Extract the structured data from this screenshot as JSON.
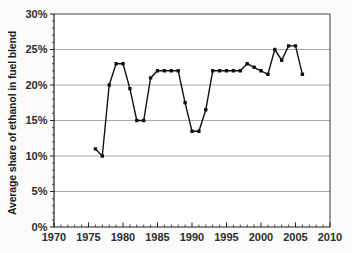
{
  "chart_data": {
    "type": "line",
    "title": "",
    "xlabel": "",
    "ylabel": "Average share of ethanol in fuel blend",
    "x": [
      1976,
      1977,
      1978,
      1979,
      1980,
      1981,
      1982,
      1983,
      1984,
      1985,
      1986,
      1987,
      1988,
      1989,
      1990,
      1991,
      1992,
      1993,
      1994,
      1995,
      1996,
      1997,
      1998,
      1999,
      2000,
      2001,
      2002,
      2003,
      2004,
      2005,
      2006
    ],
    "values": [
      11,
      10,
      20,
      23,
      23,
      19.5,
      15,
      15,
      21,
      22,
      22,
      22,
      22,
      17.5,
      13.5,
      13.5,
      16.5,
      22,
      22,
      22,
      22,
      22,
      23,
      22.5,
      22,
      21.5,
      25,
      23.5,
      25.5,
      25.5,
      21.5
    ],
    "xlim": [
      1970,
      2010
    ],
    "ylim": [
      0,
      30
    ],
    "xticks": [
      1970,
      1975,
      1980,
      1985,
      1990,
      1995,
      2000,
      2005,
      2010
    ],
    "xtick_labels": [
      "1970",
      "1975",
      "1980",
      "1985",
      "1990",
      "1995",
      "2000",
      "2005",
      "2010"
    ],
    "yticks": [
      0,
      5,
      10,
      15,
      20,
      25,
      30
    ],
    "ytick_labels": [
      "0%",
      "5%",
      "10%",
      "15%",
      "20%",
      "25%",
      "30%"
    ],
    "x_minor_step": 1,
    "y_minor_step": 1,
    "grid": "horizontal-major",
    "legend": "none",
    "marker": "square",
    "colors": {
      "line": "#111111",
      "marker": "#111111",
      "grid": "#a8a8a8",
      "frame": "#4a4a4a",
      "axis": "#1f1f1f",
      "tick_text": "#2d2d2d",
      "label_text": "#1c1c1c",
      "plot_bg": "#ffffff",
      "page_bg": "#fbfbfa"
    }
  }
}
